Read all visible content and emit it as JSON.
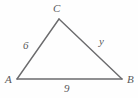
{
  "figure": {
    "kind": "triangle-diagram",
    "stroke_color": "#6b6b6d",
    "label_color": "#59595b",
    "background_color": "#fefefe",
    "vertices": [
      {
        "name": "C",
        "label": "C",
        "x": 59,
        "y": 19
      },
      {
        "name": "A",
        "label": "A",
        "x": 17,
        "y": 79
      },
      {
        "name": "B",
        "label": "B",
        "x": 122,
        "y": 79
      }
    ],
    "sides": [
      {
        "name": "side-AC",
        "label": "6",
        "from": "A",
        "to": "C"
      },
      {
        "name": "side-CB",
        "label": "y",
        "from": "C",
        "to": "B"
      },
      {
        "name": "side-AB",
        "label": "9",
        "from": "A",
        "to": "B"
      }
    ],
    "labels": {
      "vertex_C": "C",
      "vertex_A": "A",
      "vertex_B": "B",
      "side_b": "6",
      "side_a": "y",
      "side_c": "9"
    }
  }
}
